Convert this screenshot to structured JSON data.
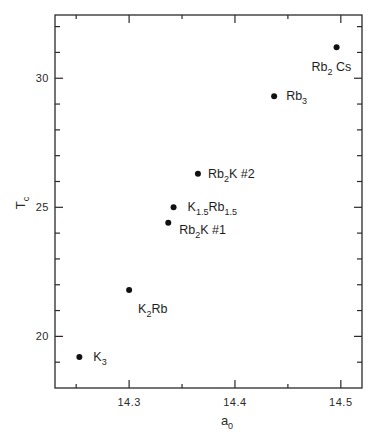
{
  "chart_data": {
    "type": "scatter",
    "title": "",
    "xlabel": "a",
    "xlabel_sub": "0",
    "ylabel": "T",
    "ylabel_sub": "c",
    "xlim": [
      14.23,
      14.52
    ],
    "ylim": [
      18.0,
      32.45
    ],
    "x_major_ticks": [
      14.3,
      14.4,
      14.5
    ],
    "x_major_tick_labels": [
      "14.3",
      "14.4",
      "14.5"
    ],
    "x_minor_ticks": [
      14.25,
      14.35,
      14.45
    ],
    "y_major_ticks": [
      20,
      25,
      30
    ],
    "y_major_tick_labels": [
      "20",
      "25",
      "30"
    ],
    "y_minor_ticks": [
      19,
      21,
      22,
      23,
      24,
      26,
      27,
      28,
      29,
      31,
      32
    ],
    "grid": false,
    "legend": null,
    "points": [
      {
        "name": "K3",
        "label": "K",
        "label_sub": "3",
        "label_rest": "",
        "label_sub2": "",
        "label_tail": "",
        "x": 14.253,
        "y": 19.2,
        "label_dx": 14,
        "label_dy": 4
      },
      {
        "name": "K2Rb",
        "label": "K",
        "label_sub": "2",
        "label_rest": "Rb",
        "label_sub2": "",
        "label_tail": "",
        "x": 14.3,
        "y": 21.8,
        "label_dx": 9,
        "label_dy": 23
      },
      {
        "name": "Rb2K #1",
        "label": "Rb",
        "label_sub": "2",
        "label_rest": "K",
        "label_sub2": "",
        "label_tail": " #1",
        "x": 14.337,
        "y": 24.4,
        "label_dx": 11,
        "label_dy": 11
      },
      {
        "name": "K1.5Rb1.5",
        "label": "K",
        "label_sub": "1.5",
        "label_rest": "Rb",
        "label_sub2": "1.5",
        "label_tail": "",
        "x": 14.342,
        "y": 25.0,
        "label_dx": 14,
        "label_dy": 4
      },
      {
        "name": "Rb2K #2",
        "label": "Rb",
        "label_sub": "2",
        "label_rest": "K",
        "label_sub2": "",
        "label_tail": " #2",
        "x": 14.365,
        "y": 26.3,
        "label_dx": 10,
        "label_dy": 4
      },
      {
        "name": "Rb3",
        "label": "Rb",
        "label_sub": "3",
        "label_rest": "",
        "label_sub2": "",
        "label_tail": "",
        "x": 14.437,
        "y": 29.3,
        "label_dx": 12,
        "label_dy": 4
      },
      {
        "name": "Rb2Cs",
        "label": "Rb",
        "label_sub": "2",
        "label_rest": " Cs",
        "label_sub2": "",
        "label_tail": "",
        "x": 14.496,
        "y": 31.2,
        "label_dx": -25,
        "label_dy": 24
      }
    ],
    "series": [
      {
        "name": "Tc vs a0",
        "x": [
          14.253,
          14.3,
          14.337,
          14.342,
          14.365,
          14.437,
          14.496
        ],
        "y": [
          19.2,
          21.8,
          24.4,
          25.0,
          26.3,
          29.3,
          31.2
        ],
        "labels": [
          "K3",
          "K2Rb",
          "Rb2K #1",
          "K1.5Rb1.5",
          "Rb2K #2",
          "Rb3",
          "Rb2Cs"
        ]
      }
    ]
  },
  "layout": {
    "plot_left": 55,
    "plot_top": 15,
    "plot_right": 362,
    "plot_bottom": 388
  }
}
